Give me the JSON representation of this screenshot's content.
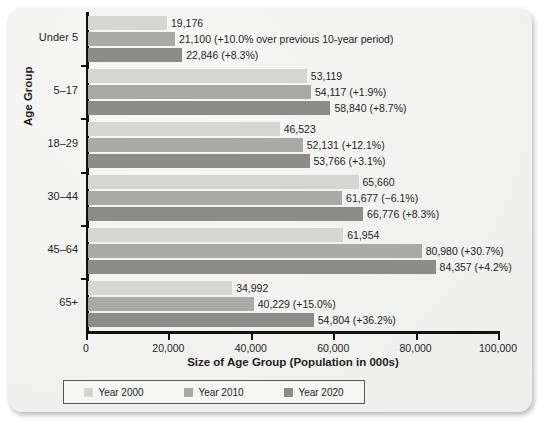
{
  "chart_data": {
    "type": "bar",
    "orientation": "horizontal",
    "title": "",
    "xlabel": "Size of Age Group (Population in 000s)",
    "ylabel": "Age Group",
    "xlim": [
      0,
      100000
    ],
    "xticks": [
      0,
      20000,
      40000,
      60000,
      80000,
      100000
    ],
    "xtick_labels": [
      "0",
      "20,000",
      "40,000",
      "60,000",
      "80,000",
      "100,000"
    ],
    "grid": false,
    "legend_position": "bottom",
    "categories": [
      "Under 5",
      "5–17",
      "18–29",
      "30–44",
      "45–64",
      "65+"
    ],
    "series": [
      {
        "name": "Year 2000",
        "color": "#d5d5d3",
        "values": [
          19176,
          53119,
          46523,
          65660,
          61954,
          34992
        ],
        "labels": [
          "19,176",
          "53,119",
          "46,523",
          "65,660",
          "61,954",
          "34,992"
        ]
      },
      {
        "name": "Year 2010",
        "color": "#a9a9a7",
        "values": [
          21100,
          54117,
          52131,
          61677,
          80980,
          40229
        ],
        "labels": [
          "21,100 (+10.0% over previous 10-year period)",
          "54,117 (+1.9%)",
          "52,131 (+12.1%)",
          "61,677 (−6.1%)",
          "80,980 (+30.7%)",
          "40,229 (+15.0%)"
        ]
      },
      {
        "name": "Year 2020",
        "color": "#8b8b89",
        "values": [
          22846,
          58840,
          53766,
          66776,
          84357,
          54804
        ],
        "labels": [
          "22,846 (+8.3%)",
          "58,840 (+8.7%)",
          "53,766 (+3.1%)",
          "66,776 (+8.3%)",
          "84,357 (+4.2%)",
          "54,804 (+36.2%)"
        ]
      }
    ]
  },
  "legend": {
    "items": [
      {
        "label": "Year 2000"
      },
      {
        "label": "Year 2010"
      },
      {
        "label": "Year 2020"
      }
    ]
  }
}
